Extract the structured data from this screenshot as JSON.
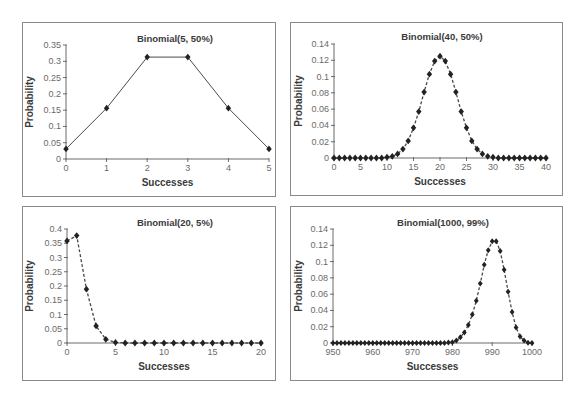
{
  "chart_data": [
    {
      "id": "binom-5-50",
      "type": "line",
      "title": "Binomial(5, 50%)",
      "xlabel": "Successes",
      "ylabel": "Probability",
      "line_style": "solid",
      "marker": "diamond",
      "xlim": [
        0,
        5
      ],
      "ylim": [
        0,
        0.35
      ],
      "xticks": [
        0,
        1,
        2,
        3,
        4,
        5
      ],
      "xtick_labels": [
        "0",
        "1",
        "2",
        "3",
        "4",
        "5"
      ],
      "yticks": [
        0,
        0.05,
        0.1,
        0.15,
        0.2,
        0.25,
        0.3,
        0.35
      ],
      "ytick_labels": [
        "0",
        "0.05",
        "0.1",
        "0.15",
        "0.2",
        "0.25",
        "0.3",
        "0.35"
      ],
      "x": [
        0,
        1,
        2,
        3,
        4,
        5
      ],
      "values": [
        0.031,
        0.156,
        0.313,
        0.313,
        0.156,
        0.031
      ],
      "grid": false
    },
    {
      "id": "binom-40-50",
      "type": "line",
      "title": "Binomial(40, 50%)",
      "xlabel": "Successes",
      "ylabel": "Probability",
      "line_style": "dashed",
      "marker": "diamond",
      "xlim": [
        0,
        40
      ],
      "ylim": [
        0,
        0.14
      ],
      "xticks": [
        0,
        5,
        10,
        15,
        20,
        25,
        30,
        35,
        40
      ],
      "xtick_labels": [
        "0",
        "5",
        "10",
        "15",
        "20",
        "25",
        "30",
        "35",
        "40"
      ],
      "yticks": [
        0,
        0.02,
        0.04,
        0.06,
        0.08,
        0.1,
        0.12,
        0.14
      ],
      "ytick_labels": [
        "0",
        "0.02",
        "0.04",
        "0.06",
        "0.08",
        "0.1",
        "0.12",
        "0.14"
      ],
      "x": [
        0,
        1,
        2,
        3,
        4,
        5,
        6,
        7,
        8,
        9,
        10,
        11,
        12,
        13,
        14,
        15,
        16,
        17,
        18,
        19,
        20,
        21,
        22,
        23,
        24,
        25,
        26,
        27,
        28,
        29,
        30,
        31,
        32,
        33,
        34,
        35,
        36,
        37,
        38,
        39,
        40
      ],
      "values": [
        0,
        0,
        0,
        0,
        0,
        0,
        0,
        0,
        0,
        0,
        0.001,
        0.002,
        0.005,
        0.011,
        0.021,
        0.037,
        0.057,
        0.081,
        0.103,
        0.119,
        0.125,
        0.119,
        0.103,
        0.081,
        0.057,
        0.037,
        0.021,
        0.011,
        0.005,
        0.002,
        0.001,
        0,
        0,
        0,
        0,
        0,
        0,
        0,
        0,
        0,
        0
      ],
      "grid": false
    },
    {
      "id": "binom-20-5",
      "type": "line",
      "title": "Binomial(20, 5%)",
      "xlabel": "Successes",
      "ylabel": "Probability",
      "line_style": "dashed",
      "marker": "diamond",
      "xlim": [
        0,
        20
      ],
      "ylim": [
        0,
        0.4
      ],
      "xticks": [
        0,
        5,
        10,
        15,
        20
      ],
      "xtick_labels": [
        "0",
        "5",
        "10",
        "15",
        "20"
      ],
      "yticks": [
        0,
        0.05,
        0.1,
        0.15,
        0.2,
        0.25,
        0.3,
        0.35,
        0.4
      ],
      "ytick_labels": [
        "0",
        "0.05",
        "0.1",
        "0.15",
        "0.2",
        "0.25",
        "0.3",
        "0.35",
        "0.4"
      ],
      "x": [
        0,
        1,
        2,
        3,
        4,
        5,
        6,
        7,
        8,
        9,
        10,
        11,
        12,
        13,
        14,
        15,
        16,
        17,
        18,
        19,
        20
      ],
      "values": [
        0.358,
        0.377,
        0.189,
        0.06,
        0.013,
        0.002,
        0,
        0,
        0,
        0,
        0,
        0,
        0,
        0,
        0,
        0,
        0,
        0,
        0,
        0,
        0
      ],
      "grid": false
    },
    {
      "id": "binom-1000-99",
      "type": "line",
      "title": "Binomial(1000, 99%)",
      "xlabel": "Successes",
      "ylabel": "Probability",
      "line_style": "dashed",
      "marker": "diamond",
      "xlim": [
        950,
        1000
      ],
      "ylim": [
        0,
        0.14
      ],
      "xticks": [
        950,
        960,
        970,
        980,
        990,
        1000
      ],
      "xtick_labels": [
        "950",
        "960",
        "970",
        "980",
        "990",
        "1000"
      ],
      "yticks": [
        0,
        0.02,
        0.04,
        0.06,
        0.08,
        0.1,
        0.12,
        0.14
      ],
      "ytick_labels": [
        "0",
        "0.02",
        "0.04",
        "0.06",
        "0.08",
        "0.1",
        "0.12",
        "0.14"
      ],
      "x": [
        950,
        951,
        952,
        953,
        954,
        955,
        956,
        957,
        958,
        959,
        960,
        961,
        962,
        963,
        964,
        965,
        966,
        967,
        968,
        969,
        970,
        971,
        972,
        973,
        974,
        975,
        976,
        977,
        978,
        979,
        980,
        981,
        982,
        983,
        984,
        985,
        986,
        987,
        988,
        989,
        990,
        991,
        992,
        993,
        994,
        995,
        996,
        997,
        998,
        999,
        1000
      ],
      "values": [
        0,
        0,
        0,
        0,
        0,
        0,
        0,
        0,
        0,
        0,
        0,
        0,
        0,
        0,
        0,
        0,
        0,
        0,
        0,
        0,
        0,
        0,
        0,
        0,
        0,
        0,
        0,
        0,
        0,
        0.0005,
        0.001,
        0.003,
        0.007,
        0.013,
        0.022,
        0.035,
        0.052,
        0.073,
        0.096,
        0.114,
        0.125,
        0.125,
        0.113,
        0.09,
        0.063,
        0.038,
        0.019,
        0.008,
        0.003,
        0.0004,
        0
      ],
      "grid": false
    }
  ],
  "colors": {
    "line": "#4a4a4a",
    "marker": "#222222",
    "axis": "#6a6a6a",
    "border": "#8a8a8a"
  }
}
